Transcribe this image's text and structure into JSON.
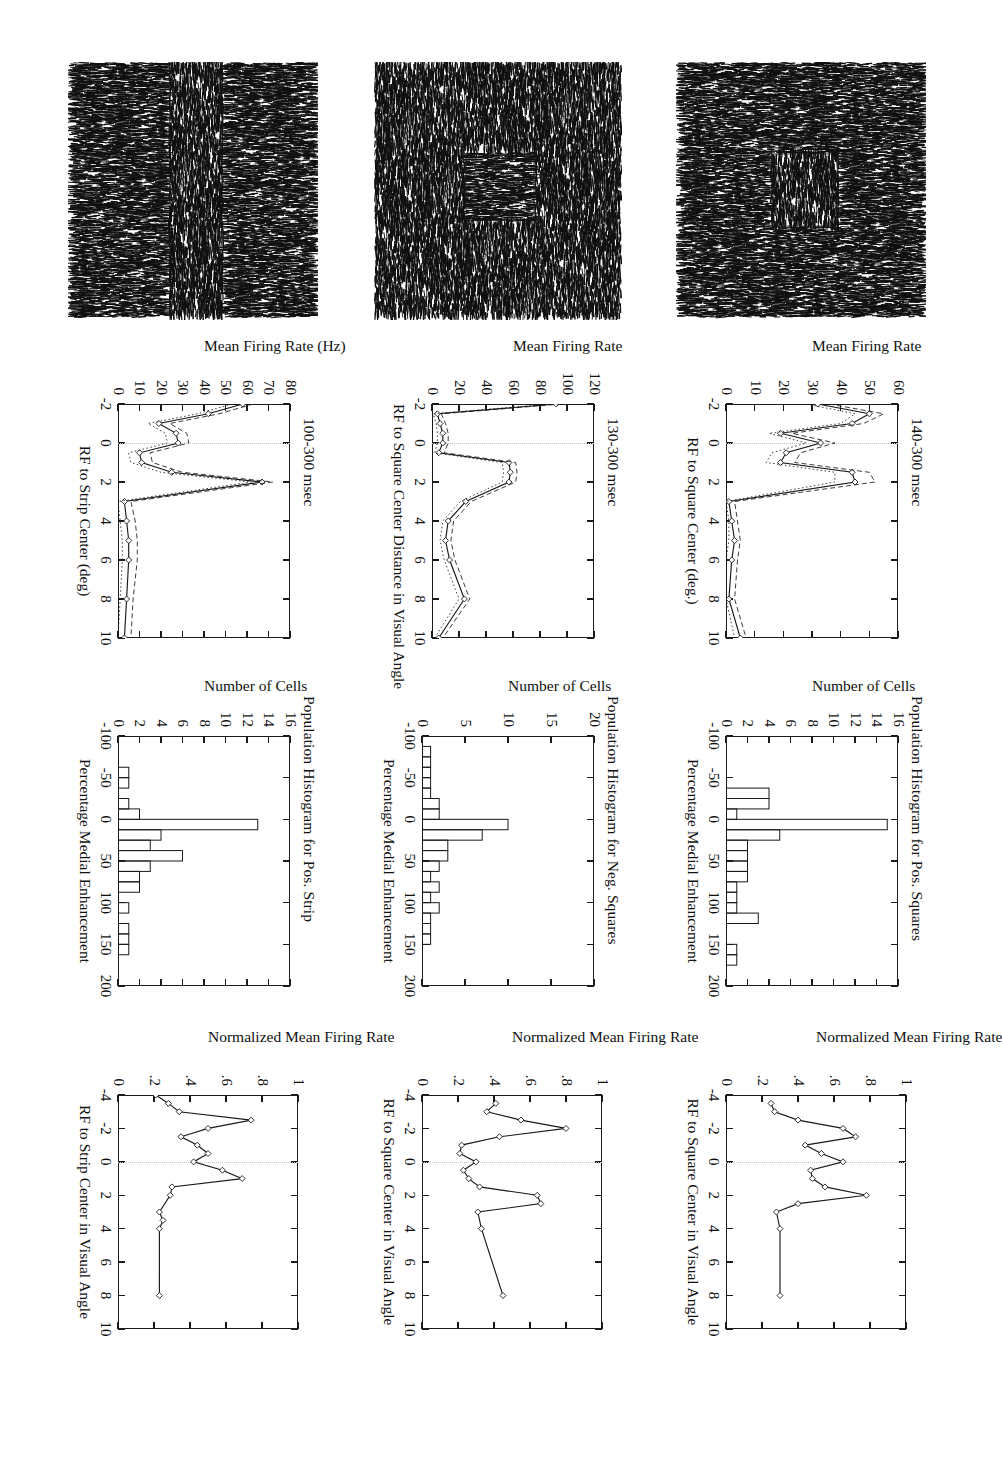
{
  "figure": {
    "orientation": "landscape page rotated 90 degrees",
    "rows": 3,
    "columns": 4
  },
  "columns": [
    {
      "name": "stimulus",
      "label": "Texture stimulus image"
    },
    {
      "name": "time-course",
      "label": "Mean firing rate profile"
    },
    {
      "name": "histogram",
      "label": "Population histogram"
    },
    {
      "name": "normalized",
      "label": "Normalized mean firing rate profile"
    }
  ],
  "rows": [
    {
      "name": "pos-squares",
      "label": "Positive Squares"
    },
    {
      "name": "neg-squares",
      "label": "Negative Squares"
    },
    {
      "name": "pos-strip",
      "label": "Positive Strip"
    }
  ],
  "stimuli": [
    {
      "name": "stimulus-pos-square",
      "texture": "vertical-background-horizontal-square",
      "bg_orientation": "vertical",
      "fg_orientation": "horizontal",
      "shape": "square"
    },
    {
      "name": "stimulus-neg-square",
      "texture": "horizontal-background-vertical-square",
      "bg_orientation": "horizontal",
      "fg_orientation": "vertical",
      "shape": "square"
    },
    {
      "name": "stimulus-pos-strip",
      "texture": "vertical-background-horizontal-strip",
      "bg_orientation": "vertical",
      "fg_orientation": "horizontal",
      "shape": "strip"
    }
  ],
  "chart_data": [
    {
      "id": "timecourse-pos-squares",
      "type": "line",
      "title": "140-300 msec",
      "xlabel": "RF to Square Center (deg.)",
      "ylabel": "Mean Firing Rate",
      "xlim": [
        -2,
        10
      ],
      "ylim": [
        0,
        60
      ],
      "xticks": [
        -2,
        0,
        2,
        4,
        6,
        8,
        10
      ],
      "yticks": [
        0,
        10,
        20,
        30,
        40,
        50,
        60
      ],
      "grid": false,
      "zero_reference_line": 0,
      "x": [
        -2.0,
        -1.5,
        -1.0,
        -0.5,
        0.0,
        0.5,
        1.0,
        1.5,
        2.0,
        3.0,
        4.0,
        5.0,
        6.0,
        8.0,
        10.0
      ],
      "series": [
        {
          "name": "mean",
          "style": "solid-with-markers",
          "values": [
            32,
            50,
            44,
            19,
            33,
            21,
            19,
            44,
            45,
            1,
            2,
            3,
            2,
            1,
            5
          ]
        },
        {
          "name": "upper-sem",
          "style": "dashed",
          "values": [
            36,
            55,
            48,
            23,
            38,
            26,
            24,
            50,
            52,
            3,
            4,
            5,
            4,
            3,
            7
          ]
        },
        {
          "name": "lower-sem",
          "style": "dotted",
          "values": [
            28,
            45,
            40,
            15,
            28,
            16,
            14,
            38,
            38,
            0,
            1,
            1,
            0,
            0,
            3
          ]
        }
      ]
    },
    {
      "id": "timecourse-neg-squares",
      "type": "line",
      "title": "130-300 msec",
      "xlabel": "RF to Square Center Distance in Visual Angle",
      "ylabel": "Mean Firing Rate",
      "xlim": [
        -2,
        10
      ],
      "ylim": [
        0,
        120
      ],
      "xticks": [
        -2,
        0,
        2,
        4,
        6,
        8,
        10
      ],
      "yticks": [
        0,
        20,
        40,
        60,
        80,
        100,
        120
      ],
      "grid": false,
      "zero_reference_line": 0,
      "x": [
        -2.0,
        -1.5,
        -1.0,
        -0.5,
        0.0,
        0.5,
        1.0,
        1.5,
        2.0,
        3.0,
        4.0,
        5.0,
        6.0,
        8.0,
        10.0
      ],
      "series": [
        {
          "name": "mean",
          "style": "solid-with-markers",
          "values": [
            92,
            4,
            6,
            8,
            8,
            5,
            57,
            58,
            57,
            25,
            12,
            10,
            13,
            24,
            5
          ]
        },
        {
          "name": "upper-sem",
          "style": "dashed",
          "values": [
            96,
            7,
            10,
            12,
            12,
            9,
            62,
            63,
            62,
            29,
            16,
            14,
            17,
            28,
            8
          ]
        },
        {
          "name": "lower-sem",
          "style": "dotted",
          "values": [
            88,
            1,
            3,
            4,
            4,
            2,
            52,
            53,
            52,
            21,
            8,
            6,
            9,
            20,
            2
          ]
        }
      ]
    },
    {
      "id": "timecourse-pos-strip",
      "type": "line",
      "title": "100-300 msec",
      "xlabel": "RF to Strip Center (deg)",
      "ylabel": "Mean Firing Rate (Hz)",
      "xlim": [
        -2,
        10
      ],
      "ylim": [
        0,
        80
      ],
      "xticks": [
        -2,
        0,
        2,
        4,
        6,
        8,
        10
      ],
      "yticks": [
        0,
        10,
        20,
        30,
        40,
        50,
        60,
        70,
        80
      ],
      "grid": false,
      "zero_reference_line": 0,
      "x": [
        -2.0,
        -1.5,
        -1.0,
        -0.5,
        0.0,
        0.5,
        1.0,
        1.5,
        2.0,
        3.0,
        4.0,
        5.0,
        6.0,
        8.0,
        10.0
      ],
      "series": [
        {
          "name": "mean",
          "style": "solid-with-markers",
          "values": [
            58,
            42,
            19,
            27,
            28,
            10,
            11,
            25,
            67,
            3,
            4,
            5,
            5,
            4,
            3
          ]
        },
        {
          "name": "upper-sem",
          "style": "dashed",
          "values": [
            63,
            47,
            24,
            32,
            33,
            15,
            16,
            30,
            72,
            6,
            8,
            9,
            9,
            7,
            6
          ]
        },
        {
          "name": "lower-sem",
          "style": "dotted",
          "values": [
            53,
            37,
            14,
            22,
            23,
            5,
            6,
            20,
            62,
            0,
            1,
            2,
            2,
            1,
            0
          ]
        }
      ]
    },
    {
      "id": "histogram-pos-squares",
      "type": "bar",
      "title": "Population Histogram for Pos. Squares",
      "xlabel": "Percentage Medial Enhancement",
      "ylabel": "Number of Cells",
      "xlim": [
        -100,
        200
      ],
      "ylim": [
        0,
        16
      ],
      "xticks": [
        -100,
        -50,
        0,
        50,
        100,
        150,
        200
      ],
      "yticks": [
        0,
        2,
        4,
        6,
        8,
        10,
        12,
        14,
        16
      ],
      "bin_width": 12.5,
      "bin_starts": [
        -37.5,
        -25,
        -12.5,
        0,
        12.5,
        25,
        37.5,
        50,
        62.5,
        75,
        87.5,
        100,
        112.5,
        137.5,
        150,
        162.5
      ],
      "values": [
        4,
        4,
        1,
        15,
        5,
        2,
        2,
        2,
        2,
        1,
        1,
        1,
        3,
        0,
        1,
        1
      ]
    },
    {
      "id": "histogram-neg-squares",
      "type": "bar",
      "title": "Population Histogram for Neg. Squares",
      "xlabel": "Percentage Medial Enhancement",
      "ylabel": "Number of Cells",
      "xlim": [
        -100,
        200
      ],
      "ylim": [
        0,
        20
      ],
      "xticks": [
        -100,
        -50,
        0,
        50,
        100,
        150,
        200
      ],
      "yticks": [
        0,
        5,
        10,
        15,
        20
      ],
      "bin_width": 12.5,
      "bin_starts": [
        -87.5,
        -75,
        -62.5,
        -50,
        -37.5,
        -25,
        -12.5,
        0,
        12.5,
        25,
        37.5,
        50,
        62.5,
        75,
        87.5,
        100,
        112.5,
        125,
        137.5
      ],
      "values": [
        1,
        1,
        1,
        1,
        1,
        2,
        2,
        10,
        7,
        3,
        3,
        2,
        1,
        2,
        1,
        2,
        1,
        1,
        1
      ]
    },
    {
      "id": "histogram-pos-strip",
      "type": "bar",
      "title": "Population Histogram for Pos. Strip",
      "xlabel": "Percentage Medial Enhancement",
      "ylabel": "Number of Cells",
      "xlim": [
        -100,
        200
      ],
      "ylim": [
        0,
        16
      ],
      "xticks": [
        -100,
        -50,
        0,
        50,
        100,
        150,
        200
      ],
      "yticks": [
        0,
        2,
        4,
        6,
        8,
        10,
        12,
        14,
        16
      ],
      "bin_width": 12.5,
      "bin_starts": [
        -62.5,
        -50,
        -25,
        -12.5,
        0,
        12.5,
        25,
        37.5,
        50,
        62.5,
        75,
        100,
        125,
        137.5,
        150
      ],
      "values": [
        1,
        1,
        1,
        2,
        13,
        4,
        3,
        6,
        3,
        2,
        2,
        1,
        1,
        1,
        1
      ]
    },
    {
      "id": "normalized-pos-squares",
      "type": "line",
      "title": "",
      "xlabel": "RF to Square Center in Visual Angle",
      "ylabel": "Normalized Mean Firing Rate",
      "xlim": [
        -4,
        10
      ],
      "ylim": [
        0,
        1
      ],
      "xticks": [
        -4,
        -2,
        0,
        2,
        4,
        6,
        8,
        10
      ],
      "yticks": [
        0,
        0.2,
        0.4,
        0.6,
        0.8,
        1
      ],
      "grid": false,
      "zero_reference_line": 0,
      "x": [
        -3.5,
        -3.0,
        -2.5,
        -2.0,
        -1.5,
        -1.0,
        -0.5,
        0.0,
        0.5,
        1.0,
        1.5,
        2.0,
        2.5,
        3.0,
        4.0,
        8.0
      ],
      "series": [
        {
          "name": "normalized-mean",
          "style": "solid-with-markers",
          "values": [
            0.25,
            0.27,
            0.4,
            0.65,
            0.72,
            0.44,
            0.53,
            0.65,
            0.47,
            0.48,
            0.55,
            0.78,
            0.4,
            0.28,
            0.3,
            0.3
          ]
        }
      ]
    },
    {
      "id": "normalized-neg-squares",
      "type": "line",
      "title": "",
      "xlabel": "RF to Square Center in Visual Angle",
      "ylabel": "Normalized Mean Firing Rate",
      "xlim": [
        -4,
        10
      ],
      "ylim": [
        0,
        1
      ],
      "xticks": [
        -4,
        -2,
        0,
        2,
        4,
        6,
        8,
        10
      ],
      "yticks": [
        0,
        0.2,
        0.4,
        0.6,
        0.8,
        1
      ],
      "grid": false,
      "zero_reference_line": 0,
      "x": [
        -3.5,
        -3.0,
        -2.5,
        -2.0,
        -1.5,
        -1.0,
        -0.5,
        0.0,
        0.5,
        1.0,
        1.5,
        2.0,
        2.5,
        3.0,
        4.0,
        8.0
      ],
      "values": null,
      "series": [
        {
          "name": "normalized-mean",
          "style": "solid-with-markers",
          "values": [
            0.41,
            0.36,
            0.55,
            0.8,
            0.43,
            0.22,
            0.21,
            0.3,
            0.23,
            0.26,
            0.32,
            0.64,
            0.66,
            0.31,
            0.33,
            0.45
          ]
        }
      ]
    },
    {
      "id": "normalized-pos-strip",
      "type": "line",
      "title": "",
      "xlabel": "RF to Strip Center in Visual Angle",
      "ylabel": "Normalized Mean Firing Rate",
      "xlim": [
        -4,
        10
      ],
      "ylim": [
        0,
        1
      ],
      "xticks": [
        -4,
        -2,
        0,
        2,
        4,
        6,
        8,
        10
      ],
      "yticks": [
        0,
        0.2,
        0.4,
        0.6,
        0.8,
        1
      ],
      "grid": false,
      "zero_reference_line": 0,
      "x": [
        -4.0,
        -3.5,
        -3.0,
        -2.5,
        -2.0,
        -1.5,
        -1.0,
        -0.5,
        0.0,
        0.5,
        1.0,
        1.5,
        2.0,
        3.0,
        3.5,
        4.0,
        8.0
      ],
      "series": [
        {
          "name": "normalized-mean",
          "style": "solid-with-markers",
          "values": [
            0.21,
            0.28,
            0.34,
            0.74,
            0.5,
            0.35,
            0.44,
            0.5,
            0.42,
            0.58,
            0.69,
            0.3,
            0.29,
            0.23,
            0.25,
            0.23,
            0.23
          ]
        }
      ]
    }
  ]
}
